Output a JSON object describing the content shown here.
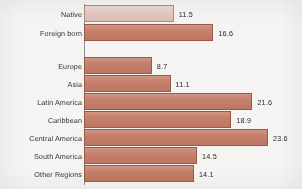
{
  "chart_data": {
    "type": "bar",
    "orientation": "horizontal",
    "title": "",
    "subtitle": "",
    "xlabel": "",
    "ylabel": "",
    "xlim": [
      0,
      23.6
    ],
    "grid": false,
    "legend": null,
    "value_labels_shown": true,
    "categories": [
      "Native",
      "Foreign born",
      "Europe",
      "Asia",
      "Latin America",
      "Caribbean",
      "Central America",
      "South America",
      "Other Regions"
    ],
    "values": [
      11.5,
      16.6,
      8.7,
      11.1,
      21.6,
      18.9,
      23.6,
      14.5,
      14.1
    ],
    "value_text": [
      "11.5",
      "16.6",
      "8.7",
      "11.1",
      "21.6",
      "18.9",
      "23.6",
      "14.5",
      "14.1"
    ],
    "groups": [
      {
        "name": "nativity",
        "categories": [
          "Native",
          "Foreign born"
        ]
      },
      {
        "name": "region-of-origin",
        "categories": [
          "Europe",
          "Asia",
          "Latin America",
          "Caribbean",
          "Central America",
          "South America",
          "Other Regions"
        ]
      }
    ],
    "bars": [
      {
        "label": "Native",
        "value": 11.5,
        "value_text": "11.5",
        "group": 0,
        "color": "#e8c9bf",
        "highlight": true
      },
      {
        "label": "Foreign born",
        "value": 16.6,
        "value_text": "16.6",
        "group": 0,
        "color": "#c97a63",
        "highlight": false
      },
      {
        "label": "Europe",
        "value": 8.7,
        "value_text": "8.7",
        "group": 1,
        "color": "#c97a63",
        "highlight": false
      },
      {
        "label": "Asia",
        "value": 11.1,
        "value_text": "11.1",
        "group": 1,
        "color": "#c97a63",
        "highlight": false
      },
      {
        "label": "Latin America",
        "value": 21.6,
        "value_text": "21.6",
        "group": 1,
        "color": "#c97a63",
        "highlight": false
      },
      {
        "label": "Caribbean",
        "value": 18.9,
        "value_text": "18.9",
        "group": 1,
        "color": "#c97a63",
        "highlight": false
      },
      {
        "label": "Central America",
        "value": 23.6,
        "value_text": "23.6",
        "group": 1,
        "color": "#c97a63",
        "highlight": false
      },
      {
        "label": "South America",
        "value": 14.5,
        "value_text": "14.5",
        "group": 1,
        "color": "#c97a63",
        "highlight": false
      },
      {
        "label": "Other Regions",
        "value": 14.1,
        "value_text": "14.1",
        "group": 1,
        "color": "#c97a63",
        "highlight": false
      }
    ],
    "colors": {
      "bar_fill": "#c97a63",
      "bar_fill_highlight": "#e8c9bf",
      "bar_stroke": "#9a5544",
      "axis": "#8a8a88",
      "text": "#2b2b2b",
      "background": "#fdfcfa"
    }
  }
}
